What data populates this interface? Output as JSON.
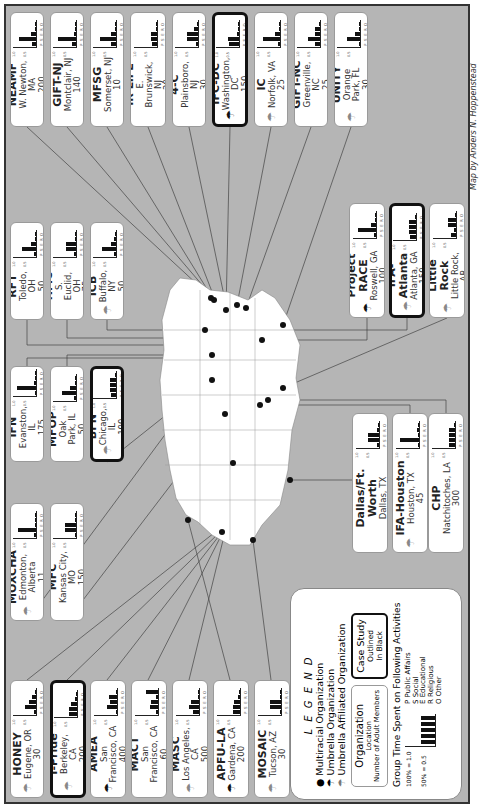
{
  "credit": "Map by Anders N. Hoppenstead",
  "legend": {
    "title": "L E G E N D",
    "multiracial": "Multiracial Organization",
    "umbrella": "Umbrella Organization",
    "umbrella_affiliated": "Umbrella Affiliated Organization",
    "sample_box": {
      "name": "Organization",
      "location": "Location",
      "members": "Number of Adult Members"
    },
    "case_study": {
      "title": "Case Study",
      "line2": "Outlined",
      "line3": "In Black"
    },
    "chart_title": "Group Time Spent on Following Activities",
    "y100": "100% = 1.0",
    "y50": "50% = 0.5",
    "activities": [
      {
        "code": "P",
        "label": "Public Affairs"
      },
      {
        "code": "S",
        "label": "Social"
      },
      {
        "code": "E",
        "label": "Educational"
      },
      {
        "code": "R",
        "label": "Religious"
      },
      {
        "code": "O",
        "label": "Other"
      }
    ]
  },
  "chart_data": {
    "type": "bar",
    "title": "Group Time Spent on Following Activities",
    "categories": [
      "P",
      "S",
      "E",
      "R",
      "O"
    ],
    "ylim": [
      0,
      1.0
    ],
    "yticks": [
      "0.5",
      "1.0"
    ],
    "organizations": [
      {
        "name": "NEAMF",
        "location": "W. Newton, MA",
        "members": "200",
        "icon": "",
        "case": false,
        "values": [
          0.15,
          0.7,
          0.2,
          0,
          0.05
        ]
      },
      {
        "name": "GIFT-NJ",
        "location": "Montclair, NJ",
        "members": "140",
        "icon": "",
        "case": false,
        "values": [
          0.15,
          0.75,
          0.1,
          0,
          0
        ]
      },
      {
        "name": "MFSG",
        "location": "Somerset, NJ",
        "members": "10",
        "icon": "",
        "case": false,
        "values": [
          0.2,
          0.65,
          0.2,
          0,
          0
        ]
      },
      {
        "name": "IR LIFE",
        "location": "E. Brunswick, NJ",
        "members": "20",
        "icon": "",
        "case": false,
        "values": [
          0.2,
          0.25,
          0.25,
          0,
          0
        ]
      },
      {
        "name": "4-C",
        "location": "Plainsboro, NJ",
        "members": "30",
        "icon": "",
        "case": false,
        "values": [
          0.1,
          0.45,
          0.45,
          0.15,
          0
        ]
      },
      {
        "name": "IFC-DC",
        "location": "Washington, DC",
        "members": "150",
        "icon": "umbrella",
        "case": true,
        "values": [
          0.4,
          0.45,
          0.1,
          0.05,
          0
        ]
      },
      {
        "name": "IC",
        "location": "Norfolk, VA",
        "members": "25",
        "icon": "umbrella-affiliated",
        "case": false,
        "values": [
          0.1,
          0.7,
          0.2,
          0,
          0
        ]
      },
      {
        "name": "GIFT-NC",
        "location": "Greenville, NC",
        "members": "25",
        "icon": "",
        "case": false,
        "values": [
          0.2,
          0.5,
          0.2,
          0.2,
          0
        ]
      },
      {
        "name": "UNITY",
        "location": "Orange Park, FL",
        "members": "30",
        "icon": "umbrella-affiliated",
        "case": false,
        "values": [
          0.05,
          0.55,
          0.2,
          0,
          0.05
        ]
      },
      {
        "name": "RFT",
        "location": "Toledo, OH",
        "members": "50",
        "icon": "",
        "case": false,
        "values": [
          0.1,
          0.6,
          0.2,
          0.05,
          0
        ]
      },
      {
        "name": "HMC",
        "location": "S. Euclid, OH",
        "members": "75",
        "icon": "",
        "case": false,
        "values": [
          0.1,
          0.4,
          0.4,
          0,
          0
        ]
      },
      {
        "name": "ICB",
        "location": "Buffalo, NY",
        "members": "50",
        "icon": "umbrella-affiliated",
        "case": false,
        "values": [
          0.1,
          0.6,
          0.2,
          0.1,
          0
        ]
      },
      {
        "name": "IFN",
        "location": "Evanston, IL",
        "members": "175",
        "icon": "",
        "case": false,
        "values": [
          0.05,
          0.8,
          0.1,
          0.05,
          0
        ]
      },
      {
        "name": "MFOP",
        "location": "Oak Park, IL",
        "members": "50",
        "icon": "",
        "case": false,
        "values": [
          0.1,
          0.6,
          0.25,
          0.05,
          0
        ]
      },
      {
        "name": "BFN",
        "location": "Chicago, IL",
        "members": "100",
        "icon": "umbrella-affiliated",
        "case": true,
        "values": [
          0.2,
          0.25,
          0.25,
          0.25,
          0.05
        ]
      },
      {
        "name": "MOXCHA",
        "location": "Edmonton, Alberta",
        "members": "11",
        "icon": "umbrella-affiliated",
        "case": false,
        "values": [
          0.1,
          0.75,
          0.05,
          0,
          0.05
        ]
      },
      {
        "name": "MFC",
        "location": "Kansas City, MO",
        "members": "150",
        "icon": "",
        "case": false,
        "values": [
          0.05,
          0.45,
          0.45,
          0,
          0
        ]
      },
      {
        "name": "HONEY",
        "location": "Eugene, OR",
        "members": "30",
        "icon": "umbrella-affiliated",
        "case": false,
        "values": [
          0.1,
          0.45,
          0.3,
          0.15,
          0
        ]
      },
      {
        "name": "I-Pride",
        "location": "Berkeley, CA",
        "members": "200",
        "icon": "umbrella-affiliated",
        "case": true,
        "values": [
          0.35,
          0.35,
          0.25,
          0.1,
          0
        ]
      },
      {
        "name": "AMEA",
        "location": "San Francisco, CA",
        "members": "400",
        "icon": "umbrella",
        "case": false,
        "values": [
          0.05,
          0.4,
          0.3,
          0.35,
          0
        ]
      },
      {
        "name": "MACT",
        "location": "San Francisco, CA",
        "members": "60",
        "icon": "",
        "case": false,
        "values": [
          0.1,
          0.35,
          0.3,
          0.1,
          0.5
        ]
      },
      {
        "name": "MASC",
        "location": "Los Angeles, CA",
        "members": "500",
        "icon": "umbrella-affiliated",
        "case": false,
        "values": [
          0.25,
          0.4,
          0.35,
          0,
          0
        ]
      },
      {
        "name": "APFU-LA",
        "location": "Gardena, CA",
        "members": "200",
        "icon": "umbrella",
        "case": false,
        "values": [
          0.3,
          0.3,
          0.25,
          0.1,
          0
        ]
      },
      {
        "name": "MOSAIC",
        "location": "Tucson, AZ",
        "members": "30",
        "icon": "umbrella-affiliated",
        "case": false,
        "values": [
          0,
          0.45,
          0.45,
          0,
          0
        ]
      },
      {
        "name": "IFA-Dallas/Ft. Worth",
        "location": "Dallas, TX",
        "members": "100",
        "icon": "",
        "case": false,
        "values": [
          0.1,
          0.45,
          0.45,
          0.1,
          0
        ]
      },
      {
        "name": "IFA-Houston",
        "location": "Houston, TX",
        "members": "45",
        "icon": "umbrella-affiliated",
        "case": false,
        "values": [
          0.05,
          0.8,
          0.05,
          0.1,
          0
        ]
      },
      {
        "name": "CHP",
        "location": "Natchitoches, LA",
        "members": "300",
        "icon": "",
        "case": false,
        "values": [
          0.25,
          0.25,
          0.25,
          0.25,
          0
        ]
      },
      {
        "name": "Project RACE",
        "location": "Roswell, GA",
        "members": "100",
        "icon": "umbrella",
        "case": false,
        "values": [
          0.1,
          0.75,
          0.2,
          0.05,
          0
        ]
      },
      {
        "name": "IFA-Atlanta",
        "location": "Atlanta, GA",
        "members": "150",
        "icon": "umbrella-affiliated",
        "case": true,
        "values": [
          0.25,
          0.3,
          0.3,
          0.3,
          0
        ]
      },
      {
        "name": "APFU-Little Rock",
        "location": "Little Rock, AR",
        "members": "30",
        "icon": "umbrella-affiliated",
        "case": false,
        "values": [
          0.2,
          0.1,
          0.35,
          0.35,
          0
        ]
      }
    ]
  },
  "layout": {
    "cards": [
      {
        "x": 10,
        "y": 12,
        "w": 34,
        "h": 115
      },
      {
        "x": 50,
        "y": 12,
        "w": 34,
        "h": 115
      },
      {
        "x": 90,
        "y": 12,
        "w": 34,
        "h": 115
      },
      {
        "x": 130,
        "y": 12,
        "w": 36,
        "h": 115
      },
      {
        "x": 172,
        "y": 12,
        "w": 34,
        "h": 115
      },
      {
        "x": 212,
        "y": 12,
        "w": 36,
        "h": 115
      },
      {
        "x": 254,
        "y": 12,
        "w": 34,
        "h": 115
      },
      {
        "x": 294,
        "y": 12,
        "w": 34,
        "h": 115
      },
      {
        "x": 334,
        "y": 12,
        "w": 34,
        "h": 115
      },
      {
        "x": 10,
        "y": 222,
        "w": 34,
        "h": 98
      },
      {
        "x": 50,
        "y": 222,
        "w": 34,
        "h": 98
      },
      {
        "x": 90,
        "y": 222,
        "w": 34,
        "h": 98
      },
      {
        "x": 10,
        "y": 366,
        "w": 34,
        "h": 96
      },
      {
        "x": 50,
        "y": 366,
        "w": 34,
        "h": 96
      },
      {
        "x": 90,
        "y": 366,
        "w": 34,
        "h": 96
      },
      {
        "x": 10,
        "y": 503,
        "w": 34,
        "h": 118
      },
      {
        "x": 50,
        "y": 503,
        "w": 34,
        "h": 118
      },
      {
        "x": 10,
        "y": 680,
        "w": 34,
        "h": 118
      },
      {
        "x": 50,
        "y": 680,
        "w": 36,
        "h": 118
      },
      {
        "x": 90,
        "y": 680,
        "w": 36,
        "h": 118
      },
      {
        "x": 131,
        "y": 680,
        "w": 36,
        "h": 118
      },
      {
        "x": 172,
        "y": 680,
        "w": 36,
        "h": 118
      },
      {
        "x": 213,
        "y": 680,
        "w": 36,
        "h": 118
      },
      {
        "x": 254,
        "y": 680,
        "w": 36,
        "h": 118
      },
      {
        "x": 352,
        "y": 413,
        "w": 36,
        "h": 140
      },
      {
        "x": 392,
        "y": 413,
        "w": 36,
        "h": 140
      },
      {
        "x": 428,
        "y": 413,
        "w": 36,
        "h": 140
      },
      {
        "x": 349,
        "y": 203,
        "w": 36,
        "h": 115
      },
      {
        "x": 389,
        "y": 203,
        "w": 36,
        "h": 115
      },
      {
        "x": 429,
        "y": 203,
        "w": 36,
        "h": 115
      }
    ]
  }
}
